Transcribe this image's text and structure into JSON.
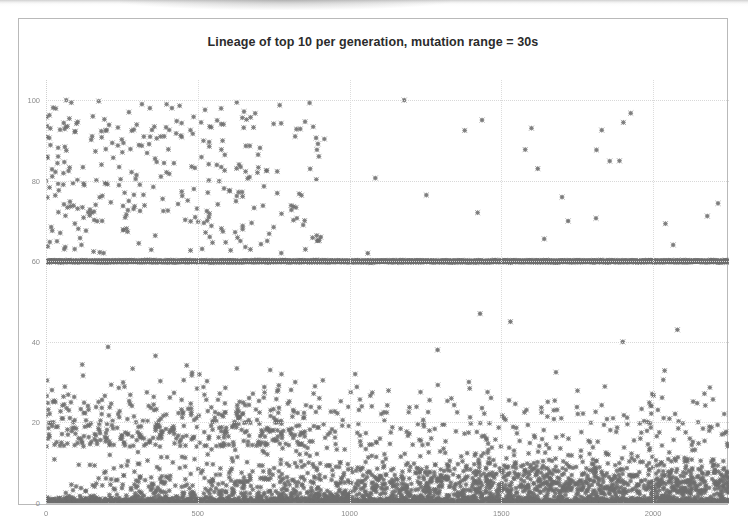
{
  "chart_data": {
    "type": "scatter",
    "title": "Lineage of top 10 per generation, mutation range = 30s",
    "xlabel": "",
    "ylabel": "",
    "xlim": [
      0,
      2250
    ],
    "ylim": [
      0,
      105
    ],
    "xticks": [
      0,
      500,
      1000,
      1500,
      2000
    ],
    "xticklabels": [
      "0",
      "500",
      "1000",
      "1500",
      "2000"
    ],
    "yticks": [
      0,
      20,
      40,
      60,
      80,
      100
    ],
    "yticklabels": [
      "0",
      "20",
      "40",
      "60",
      "80",
      "100"
    ],
    "grid": true,
    "legend": "none",
    "marker": {
      "shape": "diamond-x",
      "color": "#6e6e6e",
      "size": 2.6
    },
    "series": [
      {
        "name": "lineage-points",
        "description": "Dense scatter of lineage fitness values per generation; heavy mass near y=0 growing denser with generation, a solid saturated band of points along y=60, sparse scatter between y=60 and y=100 concentrated in early generations.",
        "point_count_estimate": 4200,
        "bands": [
          {
            "name": "baseline-band",
            "y_center": 0.6,
            "y_spread": 1.4,
            "density": "saturated",
            "x_from": 0,
            "x_to": 2250
          },
          {
            "name": "solid-line-band",
            "y_center": 60.0,
            "y_spread": 0.35,
            "density": "saturated",
            "x_from": 0,
            "x_to": 2250
          },
          {
            "name": "low-cloud",
            "y_center": 8,
            "y_spread": 9,
            "density": "very-high",
            "x_from": 0,
            "x_to": 2250
          },
          {
            "name": "mid-cloud",
            "y_center": 26,
            "y_spread": 14,
            "density": "medium",
            "x_from": 0,
            "x_to": 2250
          },
          {
            "name": "upper-cloud",
            "y_center": 80,
            "y_spread": 14,
            "density": "low",
            "x_from": 0,
            "x_to": 900
          },
          {
            "name": "upper-sparse-right",
            "y_center": 78,
            "y_spread": 16,
            "density": "very-low",
            "x_from": 900,
            "x_to": 2250
          }
        ]
      }
    ]
  },
  "chart": {
    "frame_color": "#b9b9b9",
    "background": "#ffffff",
    "grid_color": "#d8d8d8",
    "tick_color": "#8c8c8c",
    "title_color": "#2b2b2b"
  }
}
